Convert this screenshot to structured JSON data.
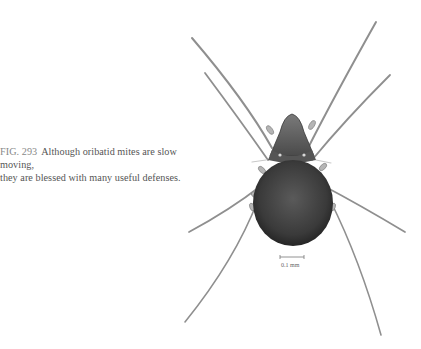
{
  "caption": {
    "figure_label": "FIG. 293",
    "line1": "Although oribatid mites are slow moving,",
    "line2": "they are blessed with many useful defenses."
  },
  "figure": {
    "scale_bar_label": "0.1 mm",
    "colors": {
      "body": "#2e2e2e",
      "legs": "#8a8a8a",
      "background": "#ffffff"
    }
  }
}
